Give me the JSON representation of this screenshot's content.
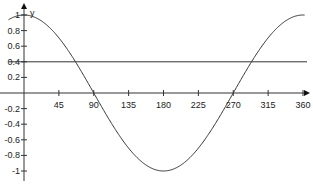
{
  "chart_data": {
    "type": "line",
    "title": "",
    "xlabel": "",
    "ylabel": "y",
    "x_ticks": [
      45,
      90,
      135,
      180,
      225,
      270,
      315,
      360
    ],
    "y_ticks": [
      1,
      0.8,
      0.6,
      0.4,
      0.2,
      -0.2,
      -0.4,
      -0.6,
      -0.8,
      -1
    ],
    "xlim": [
      -12,
      365
    ],
    "ylim": [
      -1,
      1
    ],
    "grid": false,
    "series": [
      {
        "name": "y = cos(x)",
        "function": "cos",
        "x": [
          -12,
          0,
          45,
          90,
          135,
          180,
          225,
          270,
          315,
          360
        ],
        "values": [
          0.978,
          1,
          0.707,
          0,
          -0.707,
          -1,
          -0.707,
          0,
          0.707,
          1
        ],
        "color": "#333333"
      },
      {
        "name": "y = 0.4",
        "function": "constant",
        "x": [
          -20,
          365
        ],
        "values": [
          0.4,
          0.4
        ],
        "color": "#333333"
      }
    ]
  }
}
